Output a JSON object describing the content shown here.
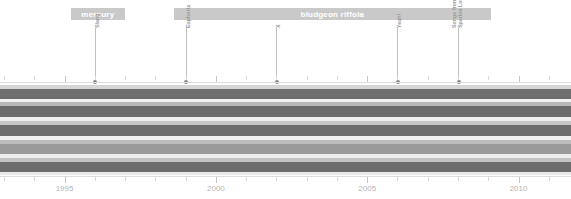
{
  "chart_data": {
    "type": "area",
    "title": "",
    "xlabel": "",
    "ylabel": "",
    "xlim": [
      1993.0,
      2011.6
    ],
    "grid": false,
    "legend": "none",
    "axis": {
      "tick_years": [
        1993,
        1994,
        1995,
        1996,
        1997,
        1998,
        1999,
        2000,
        2001,
        2002,
        2003,
        2004,
        2005,
        2006,
        2007,
        2008,
        2009,
        2010,
        2011
      ],
      "labeled_years": [
        "1995",
        "2000",
        "2005",
        "2010"
      ],
      "labeled_values": [
        1995,
        2000,
        2005,
        2010
      ]
    },
    "eras": [
      {
        "label": "mercury",
        "start": 1995.2,
        "end": 1997.0
      },
      {
        "label": "bludgeon riffola",
        "start": 1998.6,
        "end": 2009.1
      }
    ],
    "markers": [
      {
        "label": "Slang",
        "line2": "",
        "year": 1996.0
      },
      {
        "label": "Euphoria",
        "line2": "",
        "year": 1999.0
      },
      {
        "label": "X",
        "line2": "",
        "year": 2002.0
      },
      {
        "label": "Yeah!",
        "line2": "",
        "year": 2006.0
      },
      {
        "label": "Songs from the",
        "line2": "Sparkle Lounge",
        "year": 2008.0
      }
    ],
    "bands": [
      {
        "top": 85,
        "height": 4,
        "color": "#d5d5d5"
      },
      {
        "top": 89,
        "height": 10,
        "color": "#6e6e6e"
      },
      {
        "top": 99,
        "height": 3,
        "color": "#f2f2f2"
      },
      {
        "top": 102,
        "height": 4,
        "color": "#b9b9b9"
      },
      {
        "top": 106,
        "height": 11,
        "color": "#6b6b6b"
      },
      {
        "top": 117,
        "height": 4,
        "color": "#ededed"
      },
      {
        "top": 121,
        "height": 4,
        "color": "#c6c6c6"
      },
      {
        "top": 125,
        "height": 11,
        "color": "#6d6d6d"
      },
      {
        "top": 136,
        "height": 4,
        "color": "#f0f0f0"
      },
      {
        "top": 140,
        "height": 4,
        "color": "#bdbdbd"
      },
      {
        "top": 144,
        "height": 10,
        "color": "#9a9a9a"
      },
      {
        "top": 154,
        "height": 4,
        "color": "#ececec"
      },
      {
        "top": 158,
        "height": 4,
        "color": "#c2c2c2"
      },
      {
        "top": 162,
        "height": 10,
        "color": "#6c6c6c"
      },
      {
        "top": 172,
        "height": 3,
        "color": "#e9e9e9"
      }
    ]
  },
  "colors": {
    "era_band": "#c9c9c9",
    "era_text": "#ffffff",
    "marker_line": "#c0c0c0",
    "marker_dot": "#8a8a8a",
    "marker_text": "#9a9a9a",
    "axis": "#dddddd",
    "year_text": "#b5b5b5",
    "background": "#ffffff"
  }
}
